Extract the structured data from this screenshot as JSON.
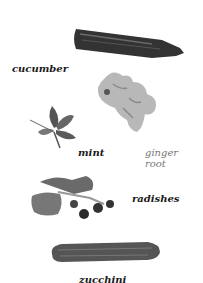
{
  "page": {
    "items": [
      {
        "name": "cucumber",
        "label": "cucumber"
      },
      {
        "name": "ginger-root",
        "label_line1": "ginger",
        "label_line2": "root"
      },
      {
        "name": "mint",
        "label": "mint"
      },
      {
        "name": "radishes",
        "label": "radishes"
      },
      {
        "name": "zucchini",
        "label": "zucchini"
      }
    ]
  }
}
